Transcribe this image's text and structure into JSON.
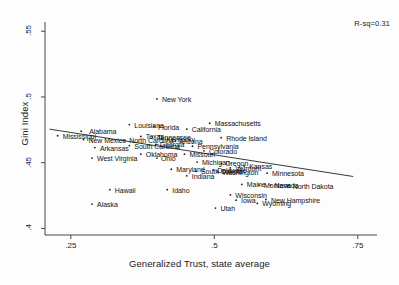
{
  "chart_data": {
    "type": "scatter",
    "title": "",
    "xlabel": "Generalized Trust, state average",
    "ylabel": "Gini Index",
    "xlim": [
      0.205,
      0.78
    ],
    "ylim": [
      0.395,
      0.557
    ],
    "xticks": [
      ".25",
      ".5",
      ".75"
    ],
    "xtickvalues": [
      0.25,
      0.5,
      0.75
    ],
    "yticks": [
      ".55",
      ".5",
      ".45",
      ".4"
    ],
    "ytickvalues": [
      0.55,
      0.5,
      0.45,
      0.4
    ],
    "grid": false,
    "legend": "none",
    "annotations": [
      {
        "name": "r-squared",
        "text": "R-sq=0.31",
        "value": 0.31
      }
    ],
    "fit_line": {
      "name": "linear-fit",
      "x0": 0.213,
      "y0": 0.4755,
      "x1": 0.742,
      "y1": 0.4395,
      "color": "#222222"
    },
    "marker_color": "#202020",
    "points": [
      {
        "label": "Alabama",
        "x": 0.268,
        "y": 0.474,
        "lx": 8,
        "ly": -3
      },
      {
        "label": "Mississippi",
        "x": 0.227,
        "y": 0.4705,
        "lx": 5,
        "ly": -3
      },
      {
        "label": "New Mexico",
        "x": 0.272,
        "y": 0.4675,
        "lx": 5,
        "ly": -3
      },
      {
        "label": "Arkansas",
        "x": 0.292,
        "y": 0.4615,
        "lx": 5,
        "ly": -3
      },
      {
        "label": "West Virginia",
        "x": 0.287,
        "y": 0.4535,
        "lx": 5,
        "ly": -3
      },
      {
        "label": "Alaska",
        "x": 0.287,
        "y": 0.4185,
        "lx": 5,
        "ly": -3
      },
      {
        "label": "Louisiana",
        "x": 0.352,
        "y": 0.479,
        "lx": 5,
        "ly": -3
      },
      {
        "label": "Florida",
        "x": 0.395,
        "y": 0.4775,
        "lx": 4,
        "ly": -3
      },
      {
        "label": "Texas",
        "x": 0.372,
        "y": 0.47,
        "lx": 5,
        "ly": -3
      },
      {
        "label": "North Carolina",
        "x": 0.343,
        "y": 0.467,
        "lx": 5,
        "ly": -3
      },
      {
        "label": "Tennessee",
        "x": 0.392,
        "y": 0.4695,
        "lx": 5,
        "ly": -3
      },
      {
        "label": "South Carolina",
        "x": 0.352,
        "y": 0.463,
        "lx": 5,
        "ly": -3
      },
      {
        "label": "Georgia",
        "x": 0.398,
        "y": 0.464,
        "lx": 4,
        "ly": -3
      },
      {
        "label": "New York",
        "x": 0.4,
        "y": 0.4985,
        "lx": 5,
        "ly": -3
      },
      {
        "label": "Kentucky",
        "x": 0.408,
        "y": 0.468,
        "lx": 5,
        "ly": -3
      },
      {
        "label": "Oklahoma",
        "x": 0.372,
        "y": 0.4565,
        "lx": 5,
        "ly": -3
      },
      {
        "label": "Ohio",
        "x": 0.4,
        "y": 0.4535,
        "lx": 4,
        "ly": -3
      },
      {
        "label": "Arizona",
        "x": 0.432,
        "y": 0.4665,
        "lx": 4,
        "ly": -3
      },
      {
        "label": "California",
        "x": 0.452,
        "y": 0.4755,
        "lx": 5,
        "ly": -3
      },
      {
        "label": "Massachusetts",
        "x": 0.492,
        "y": 0.48,
        "lx": 5,
        "ly": -3
      },
      {
        "label": "Rhode Island",
        "x": 0.512,
        "y": 0.469,
        "lx": 5,
        "ly": -3
      },
      {
        "label": "Pennsylvania",
        "x": 0.462,
        "y": 0.4625,
        "lx": 5,
        "ly": -3
      },
      {
        "label": "Colorado",
        "x": 0.482,
        "y": 0.459,
        "lx": 5,
        "ly": -3
      },
      {
        "label": "Missouri",
        "x": 0.448,
        "y": 0.4565,
        "lx": 5,
        "ly": -3
      },
      {
        "label": "Michigan",
        "x": 0.47,
        "y": 0.4505,
        "lx": 5,
        "ly": -3
      },
      {
        "label": "Oregon",
        "x": 0.512,
        "y": 0.4495,
        "lx": 4,
        "ly": -3
      },
      {
        "label": "Maryland",
        "x": 0.425,
        "y": 0.445,
        "lx": 5,
        "ly": -3
      },
      {
        "label": "South Dakota",
        "x": 0.468,
        "y": 0.4435,
        "lx": 5,
        "ly": -3
      },
      {
        "label": "Delaware",
        "x": 0.498,
        "y": 0.4445,
        "lx": 4,
        "ly": -3
      },
      {
        "label": "Indiana",
        "x": 0.452,
        "y": 0.44,
        "lx": 5,
        "ly": -3
      },
      {
        "label": "Washington",
        "x": 0.505,
        "y": 0.443,
        "lx": 5,
        "ly": -3
      },
      {
        "label": "Vermont",
        "x": 0.528,
        "y": 0.446,
        "lx": 5,
        "ly": -3
      },
      {
        "label": "Kansas",
        "x": 0.552,
        "y": 0.4475,
        "lx": 5,
        "ly": -3
      },
      {
        "label": "Minnesota",
        "x": 0.592,
        "y": 0.442,
        "lx": 5,
        "ly": -3
      },
      {
        "label": "Utah",
        "x": 0.502,
        "y": 0.4155,
        "lx": 5,
        "ly": -3
      },
      {
        "label": "Idaho",
        "x": 0.418,
        "y": 0.4295,
        "lx": 5,
        "ly": -3
      },
      {
        "label": "Hawaii",
        "x": 0.318,
        "y": 0.4295,
        "lx": 5,
        "ly": -3
      },
      {
        "label": "Wisconsin",
        "x": 0.528,
        "y": 0.4255,
        "lx": 5,
        "ly": -3
      },
      {
        "label": "Iowa",
        "x": 0.538,
        "y": 0.4215,
        "lx": 5,
        "ly": -3
      },
      {
        "label": "Maine",
        "x": 0.548,
        "y": 0.4335,
        "lx": 5,
        "ly": -3
      },
      {
        "label": "Montana",
        "x": 0.578,
        "y": 0.433,
        "lx": 5,
        "ly": -3
      },
      {
        "label": "Nevada",
        "x": 0.598,
        "y": 0.433,
        "lx": 4,
        "ly": -3
      },
      {
        "label": "North Dakota",
        "x": 0.628,
        "y": 0.4325,
        "lx": 5,
        "ly": -3
      },
      {
        "label": "Wyoming",
        "x": 0.575,
        "y": 0.419,
        "lx": 5,
        "ly": -3
      },
      {
        "label": "New Hampshire",
        "x": 0.59,
        "y": 0.422,
        "lx": 5,
        "ly": -3
      }
    ]
  },
  "figure": {
    "background_color": "#fdfdfd",
    "plot_area": {
      "left": 45,
      "top": 22,
      "right": 375,
      "bottom": 235
    }
  }
}
